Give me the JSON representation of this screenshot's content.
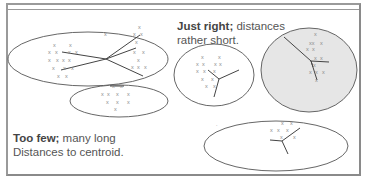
{
  "captions": {
    "too_few": {
      "bold": "Too few;",
      "line1_rest": " many long",
      "line2": "Distances to centroid."
    },
    "just_right": {
      "bold": "Just right;",
      "line1_rest": " distances",
      "line2": "rather short."
    }
  },
  "point_marker": "x",
  "colors": {
    "frame": "#9a9a9a",
    "ellipse_stroke": "#555555",
    "shaded_fill": "#e6e6e6",
    "lines": "#444444",
    "points": "#8a8a8a",
    "text": "#555555"
  },
  "groups": {
    "too_few": [
      {
        "name": "large-cluster-top-left",
        "cx": 88,
        "cy": 59,
        "rx": 80,
        "ry": 27,
        "shaded": false
      },
      {
        "name": "small-cluster-bottom-left",
        "cx": 119,
        "cy": 101,
        "rx": 49,
        "ry": 16,
        "shaded": false
      }
    ],
    "just_right": [
      {
        "name": "cluster-middle",
        "cx": 214,
        "cy": 75,
        "rx": 40,
        "ry": 31,
        "shaded": false
      },
      {
        "name": "cluster-right-shaded",
        "cx": 309,
        "cy": 70,
        "rx": 48,
        "ry": 42,
        "shaded": true
      },
      {
        "name": "cluster-bottom-right",
        "cx": 276,
        "cy": 146,
        "rx": 72,
        "ry": 25,
        "shaded": false
      }
    ]
  }
}
